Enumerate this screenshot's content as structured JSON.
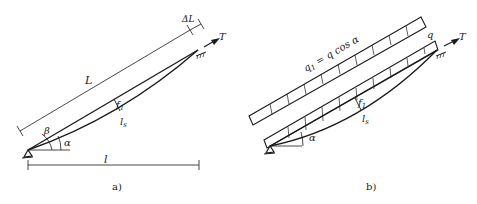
{
  "figure_a": {
    "caption": "a)",
    "labels": {
      "chord_length": "L",
      "extension": "ΔL",
      "tension": "T",
      "sag": "f",
      "sag_sub": "1",
      "arc_length": "l",
      "arc_length_sub": "s",
      "span": "l",
      "angle_beta": "β",
      "angle_alpha": "α"
    }
  },
  "figure_b": {
    "caption": "b)",
    "labels": {
      "load_perp": "q",
      "load_perp_sub": "1",
      "load_perp_eq": " = q cos α",
      "load": "q",
      "tension": "T",
      "sag": "f",
      "sag_sub": "1",
      "arc_length": "l",
      "arc_length_sub": "s",
      "angle_alpha": "α"
    }
  },
  "colors": {
    "ink": "#1a1a1a",
    "background": "#ffffff"
  }
}
